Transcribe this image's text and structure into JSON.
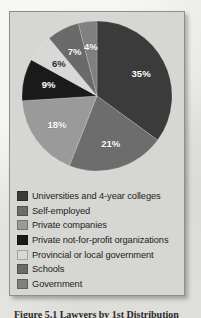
{
  "figure": {
    "caption": "Figure 5.1  Lawyers by 1st Distribution"
  },
  "chart_data": {
    "type": "pie",
    "title": "",
    "start_angle_deg": 0,
    "direction": "clockwise",
    "legend_position": "bottom",
    "grid": false,
    "categories": [
      "Universities and 4-year colleges",
      "Self-employed",
      "Private companies",
      "Private not-for-profit organizations",
      "Provincial or local government",
      "Schools",
      "Government"
    ],
    "values": [
      35,
      21,
      18,
      9,
      6,
      7,
      4
    ],
    "labels": [
      "35%",
      "21%",
      "18%",
      "9%",
      "6%",
      "7%",
      "4%"
    ],
    "colors": [
      "#3b3b3b",
      "#6d6d6d",
      "#9a9a9a",
      "#1a1a1a",
      "#d8d8d6",
      "#6a6a6a",
      "#808080"
    ],
    "slices": [
      {
        "label": "Universities and 4-year colleges",
        "value": 35,
        "display": "35%",
        "color": "#3b3b3b"
      },
      {
        "label": "Self-employed",
        "value": 21,
        "display": "21%",
        "color": "#6d6d6d"
      },
      {
        "label": "Private companies",
        "value": 18,
        "display": "18%",
        "color": "#9a9a9a"
      },
      {
        "label": "Private not-for-profit organizations",
        "value": 9,
        "display": "9%",
        "color": "#1a1a1a"
      },
      {
        "label": "Provincial or local government",
        "value": 6,
        "display": "6%",
        "color": "#d8d8d6"
      },
      {
        "label": "Schools",
        "value": 7,
        "display": "7%",
        "color": "#6a6a6a"
      },
      {
        "label": "Government",
        "value": 4,
        "display": "4%",
        "color": "#808080"
      }
    ]
  },
  "legend": {
    "items": [
      {
        "label": "Universities and 4-year colleges",
        "color": "#3b3b3b"
      },
      {
        "label": "Self-employed",
        "color": "#6d6d6d"
      },
      {
        "label": "Private companies",
        "color": "#9a9a9a"
      },
      {
        "label": "Private not-for-profit organizations",
        "color": "#1a1a1a"
      },
      {
        "label": "Provincial or local government",
        "color": "#d8d8d6"
      },
      {
        "label": "Schools",
        "color": "#6a6a6a"
      },
      {
        "label": "Government",
        "color": "#808080"
      }
    ]
  }
}
